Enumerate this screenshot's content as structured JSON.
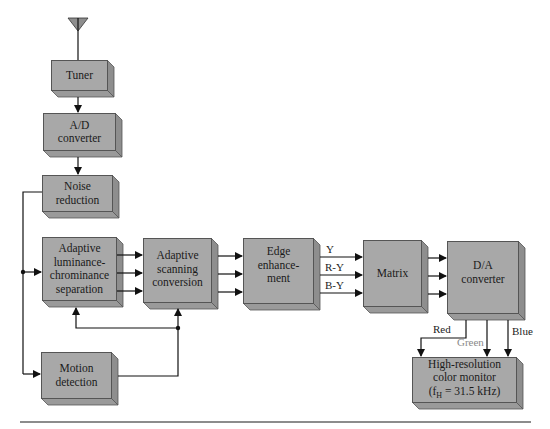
{
  "diagram": {
    "title": "",
    "blocks": [
      {
        "id": "tuner",
        "label": "Tuner"
      },
      {
        "id": "ad-converter",
        "label": "A/D converter",
        "lines": [
          "A/D",
          "converter"
        ]
      },
      {
        "id": "noise-reduction",
        "label": "Noise reduction",
        "lines": [
          "Noise",
          "reduction"
        ]
      },
      {
        "id": "adaptive-luminance-chrominance-separation",
        "label": "Adaptive luminance-chrominance separation",
        "lines": [
          "Adaptive",
          "luminance-",
          "chrominance",
          "separation"
        ]
      },
      {
        "id": "adaptive-scanning-conversion",
        "label": "Adaptive scanning conversion",
        "lines": [
          "Adaptive",
          "scanning",
          "conversion"
        ]
      },
      {
        "id": "edge-enhancement",
        "label": "Edge enhancement",
        "lines": [
          "Edge",
          "enhance-",
          "ment"
        ]
      },
      {
        "id": "matrix",
        "label": "Matrix",
        "lines": [
          "Matrix"
        ]
      },
      {
        "id": "da-converter",
        "label": "D/A converter",
        "lines": [
          "D/A",
          "converter"
        ]
      },
      {
        "id": "monitor",
        "label": "High-resolution color monitor (fH = 31.5 kHz)",
        "lines": [
          "High-resolution",
          "color monitor",
          "(fH = 31.5 kHz)"
        ]
      },
      {
        "id": "motion-detection",
        "label": "Motion detection",
        "lines": [
          "Motion",
          "detection"
        ]
      }
    ],
    "signal_labels": {
      "y": "Y",
      "r_y": "R-Y",
      "b_y": "B-Y",
      "red": "Red",
      "green": "Green",
      "blue": "Blue"
    },
    "monitor_formula": {
      "prefix": "(f",
      "subscript": "H",
      "suffix": " = 31.5 kHz)"
    },
    "edges": [
      {
        "from": "antenna",
        "to": "tuner"
      },
      {
        "from": "tuner",
        "to": "ad-converter"
      },
      {
        "from": "ad-converter",
        "to": "noise-reduction"
      },
      {
        "from": "noise-reduction",
        "to": "adaptive-luminance-chrominance-separation"
      },
      {
        "from": "noise-reduction",
        "to": "motion-detection"
      },
      {
        "from": "adaptive-luminance-chrominance-separation",
        "to": "adaptive-scanning-conversion",
        "count": 3
      },
      {
        "from": "adaptive-scanning-conversion",
        "to": "edge-enhancement",
        "count": 3
      },
      {
        "from": "edge-enhancement",
        "to": "matrix",
        "labels": [
          "Y",
          "R-Y",
          "B-Y"
        ]
      },
      {
        "from": "matrix",
        "to": "da-converter",
        "count": 3
      },
      {
        "from": "motion-detection",
        "to": "adaptive-scanning-conversion"
      },
      {
        "from": "motion-detection",
        "to": "adaptive-luminance-chrominance-separation"
      },
      {
        "from": "da-converter",
        "to": "monitor",
        "labels": [
          "Red",
          "Green",
          "Blue"
        ]
      }
    ],
    "colors": {
      "block_face": "#a8a8a8",
      "block_side": "#8e8e8e",
      "block_bottom": "#9a9a9a",
      "line": "#111111",
      "rule": "#8c8c8c",
      "green_label": "#8a8a8a"
    }
  }
}
